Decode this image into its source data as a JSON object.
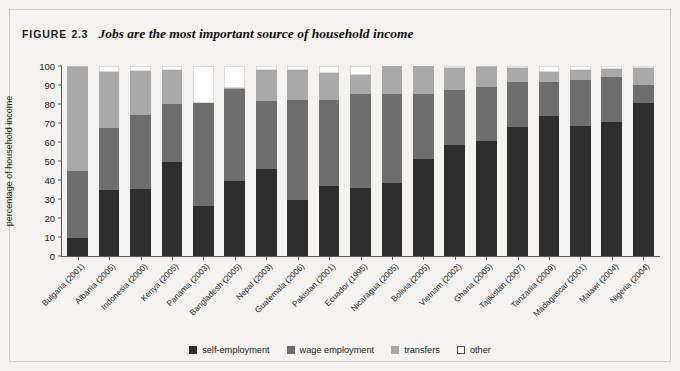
{
  "figure": {
    "label": "FIGURE",
    "number": "2.3",
    "title": "Jobs are the most important source of household income"
  },
  "colors": {
    "self_employment": "#2e2e2e",
    "wage_employment": "#6e6e6e",
    "transfers": "#a9a9a9",
    "other": "#ffffff",
    "panel_background": "#f4f3ef",
    "axis": "#5a5a5a"
  },
  "legend": {
    "position": "bottom-center",
    "items": [
      {
        "label": "self-employment",
        "color": "#2e2e2e"
      },
      {
        "label": "wage employment",
        "color": "#6e6e6e"
      },
      {
        "label": "transfers",
        "color": "#a9a9a9"
      },
      {
        "label": "other",
        "color": "#ffffff"
      }
    ]
  },
  "chart_data": {
    "type": "bar",
    "stacked": true,
    "stack_total": 100,
    "title": "Jobs are the most important source of household income",
    "xlabel": "",
    "ylabel": "percentage of household income",
    "ylim": [
      0,
      100
    ],
    "yticks": [
      0,
      10,
      20,
      30,
      40,
      50,
      60,
      70,
      80,
      90,
      100
    ],
    "ytick_labels": [
      "0",
      "10",
      "20",
      "30",
      "40",
      "50",
      "60",
      "70",
      "80",
      "90",
      "100"
    ],
    "grid": false,
    "categories": [
      "Bulgaria (2001)",
      "Albania (2005)",
      "Indonesia (2000)",
      "Kenya (2005)",
      "Panama (2003)",
      "Bangladesh (2005)",
      "Nepal (2003)",
      "Guatemala (2006)",
      "Pakistan (2001)",
      "Ecuador (1995)",
      "Nicaragua (2005)",
      "Bolivia (2005)",
      "Vietnam (2002)",
      "Ghana (2005)",
      "Tajikistan (2007)",
      "Tanzania (2009)",
      "Madagascar (2001)",
      "Malawi (2004)",
      "Nigeria (2004)"
    ],
    "series": [
      {
        "name": "self-employment",
        "color": "#2e2e2e",
        "values": [
          9.5,
          35,
          35.5,
          49.5,
          26.5,
          39.5,
          46,
          29.5,
          37,
          36,
          38.5,
          51,
          58.5,
          60.5,
          68,
          73.5,
          68.5,
          70.5,
          80.5
        ]
      },
      {
        "name": "wage employment",
        "color": "#6e6e6e",
        "values": [
          35,
          32.5,
          38.5,
          30.5,
          54,
          48.5,
          35.5,
          52.5,
          45,
          49.5,
          47,
          34.5,
          29,
          28.5,
          23.5,
          18,
          24,
          23.5,
          9.5
        ]
      },
      {
        "name": "transfers",
        "color": "#a9a9a9",
        "values": [
          55,
          29.5,
          23.5,
          18,
          0,
          0.5,
          16.5,
          16,
          14.5,
          10,
          14.5,
          14.5,
          11.5,
          10.5,
          7.5,
          5.5,
          5.5,
          4.5,
          9
        ]
      },
      {
        "name": "other",
        "color": "#ffffff",
        "values": [
          0.5,
          3,
          2.5,
          2,
          19.5,
          11.5,
          2,
          2,
          3.5,
          4.5,
          0,
          0,
          1,
          0.5,
          1,
          3,
          2,
          1.5,
          1
        ]
      }
    ]
  }
}
